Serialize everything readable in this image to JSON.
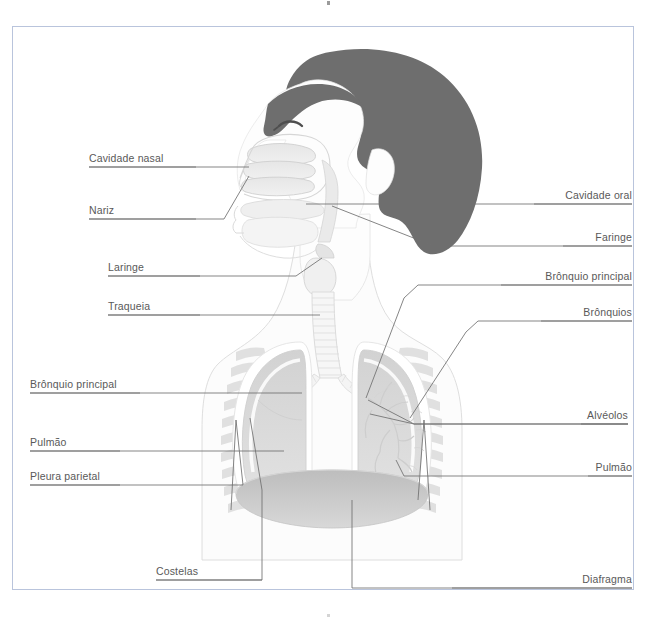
{
  "figure": {
    "credit": "snapgalleria/Shutterstock.com",
    "frame_color": "#b9c4dc",
    "label_color": "#595959",
    "leader_color": "#7d7d7d",
    "hair_color": "#6e6e6e",
    "skin_color": "#fbfbfb",
    "organ_color": "#dcdcdc",
    "diaphragm_color": "#c8c8c8"
  },
  "labels": {
    "left": [
      {
        "id": "cavidade-nasal",
        "text": "Cavidade nasal",
        "x": 89,
        "y": 152
      },
      {
        "id": "nariz",
        "text": "Nariz",
        "x": 89,
        "y": 204
      },
      {
        "id": "laringe",
        "text": "Laringe",
        "x": 108,
        "y": 261
      },
      {
        "id": "traqueia",
        "text": "Traqueia",
        "x": 108,
        "y": 300
      },
      {
        "id": "bronquio-principal-esq",
        "text": "Brônquio principal",
        "x": 30,
        "y": 378
      },
      {
        "id": "pulmao-esq",
        "text": "Pulmão",
        "x": 30,
        "y": 436
      },
      {
        "id": "pleura-parietal",
        "text": "Pleura parietal",
        "x": 30,
        "y": 470
      }
    ],
    "right": [
      {
        "id": "cavidade-oral",
        "text": "Cavidade oral",
        "x": 534,
        "y": 189
      },
      {
        "id": "faringe",
        "text": "Faringe",
        "x": 563,
        "y": 231
      },
      {
        "id": "bronquio-principal-dir",
        "text": "Brônquio principal",
        "x": 501,
        "y": 270
      },
      {
        "id": "bronquios",
        "text": "Brônquios",
        "x": 541,
        "y": 306
      },
      {
        "id": "alveolos",
        "text": "Alvéolos",
        "x": 581,
        "y": 409
      },
      {
        "id": "pulmao-dir",
        "text": "Pulmão",
        "x": 588,
        "y": 461
      }
    ],
    "bottom": [
      {
        "id": "costelas",
        "text": "Costelas",
        "x": 156,
        "y": 565
      },
      {
        "id": "diafragma",
        "text": "Diafragma",
        "x": 452,
        "y": 573
      }
    ]
  }
}
